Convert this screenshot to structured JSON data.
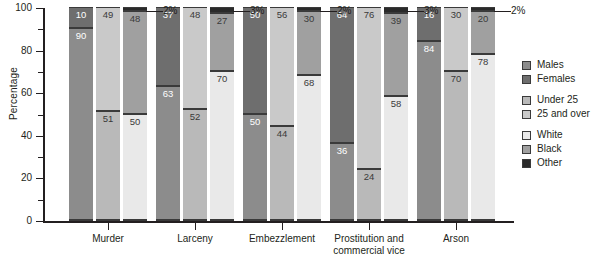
{
  "chart_data": {
    "type": "bar",
    "subtype": "100% stacked bar, grouped",
    "title": "",
    "xlabel": "",
    "ylabel": "Percentage",
    "ylim": [
      0,
      100
    ],
    "yticks": [
      0,
      20,
      40,
      60,
      80,
      100
    ],
    "yminor_ticks": [
      10,
      30,
      50,
      70,
      90
    ],
    "grid": false,
    "legend_position": "right",
    "categories": [
      "Murder",
      "Larceny",
      "Embezzlement",
      "Prostitution and commercial vice",
      "Arson"
    ],
    "bar_groups": [
      {
        "label": "Sex",
        "series": [
          {
            "name": "Males",
            "values": [
              90,
              63,
              50,
              36,
              84
            ]
          },
          {
            "name": "Females",
            "values": [
              10,
              37,
              50,
              64,
              16
            ]
          }
        ]
      },
      {
        "label": "Age",
        "series": [
          {
            "name": "Under 25",
            "values": [
              51,
              52,
              44,
              24,
              70
            ]
          },
          {
            "name": "25 and over",
            "values": [
              49,
              48,
              56,
              76,
              30
            ]
          }
        ]
      },
      {
        "label": "Race",
        "series": [
          {
            "name": "White",
            "values": [
              50,
              70,
              68,
              58,
              78
            ]
          },
          {
            "name": "Black",
            "values": [
              48,
              27,
              30,
              39,
              20
            ]
          },
          {
            "name": "Other",
            "values": [
              2,
              3,
              2,
              3,
              2
            ]
          }
        ]
      }
    ],
    "other_callouts": [
      "2%",
      "3%",
      "2%",
      "3%",
      "2%"
    ],
    "colors": {
      "males": "#8c8c8c",
      "females": "#6e6e6e",
      "under_25": "#b9b9b9",
      "25_and_over": "#c9c9c9",
      "white": "#e9e9e9",
      "black": "#a0a0a0",
      "other": "#2a2a2a",
      "axis": "#231f20",
      "background": "#ffffff"
    }
  },
  "axis": {
    "ylabel": "Percentage",
    "tick_labels": [
      "0",
      "20",
      "40",
      "60",
      "80",
      "100"
    ],
    "category_labels": [
      {
        "line1": "Murder",
        "line2": ""
      },
      {
        "line1": "Larceny",
        "line2": ""
      },
      {
        "line1": "Embezzlement",
        "line2": ""
      },
      {
        "line1": "Prostitution and",
        "line2": "commercial vice"
      },
      {
        "line1": "Arson",
        "line2": ""
      }
    ]
  },
  "legend": {
    "items": [
      {
        "label": "Males",
        "color": "#8c8c8c",
        "gap": false
      },
      {
        "label": "Females",
        "color": "#6e6e6e",
        "gap": false
      },
      {
        "label": "Under 25",
        "color": "#b9b9b9",
        "gap": true
      },
      {
        "label": "25 and over",
        "color": "#c9c9c9",
        "gap": false
      },
      {
        "label": "White",
        "color": "#e9e9e9",
        "gap": true
      },
      {
        "label": "Black",
        "color": "#a0a0a0",
        "gap": false
      },
      {
        "label": "Other",
        "color": "#2a2a2a",
        "gap": false
      }
    ]
  },
  "callout_labels": {
    "murder": "2%",
    "larceny": "3%",
    "embezzlement": "2%",
    "prostitution": "3%",
    "arson": "2%"
  }
}
